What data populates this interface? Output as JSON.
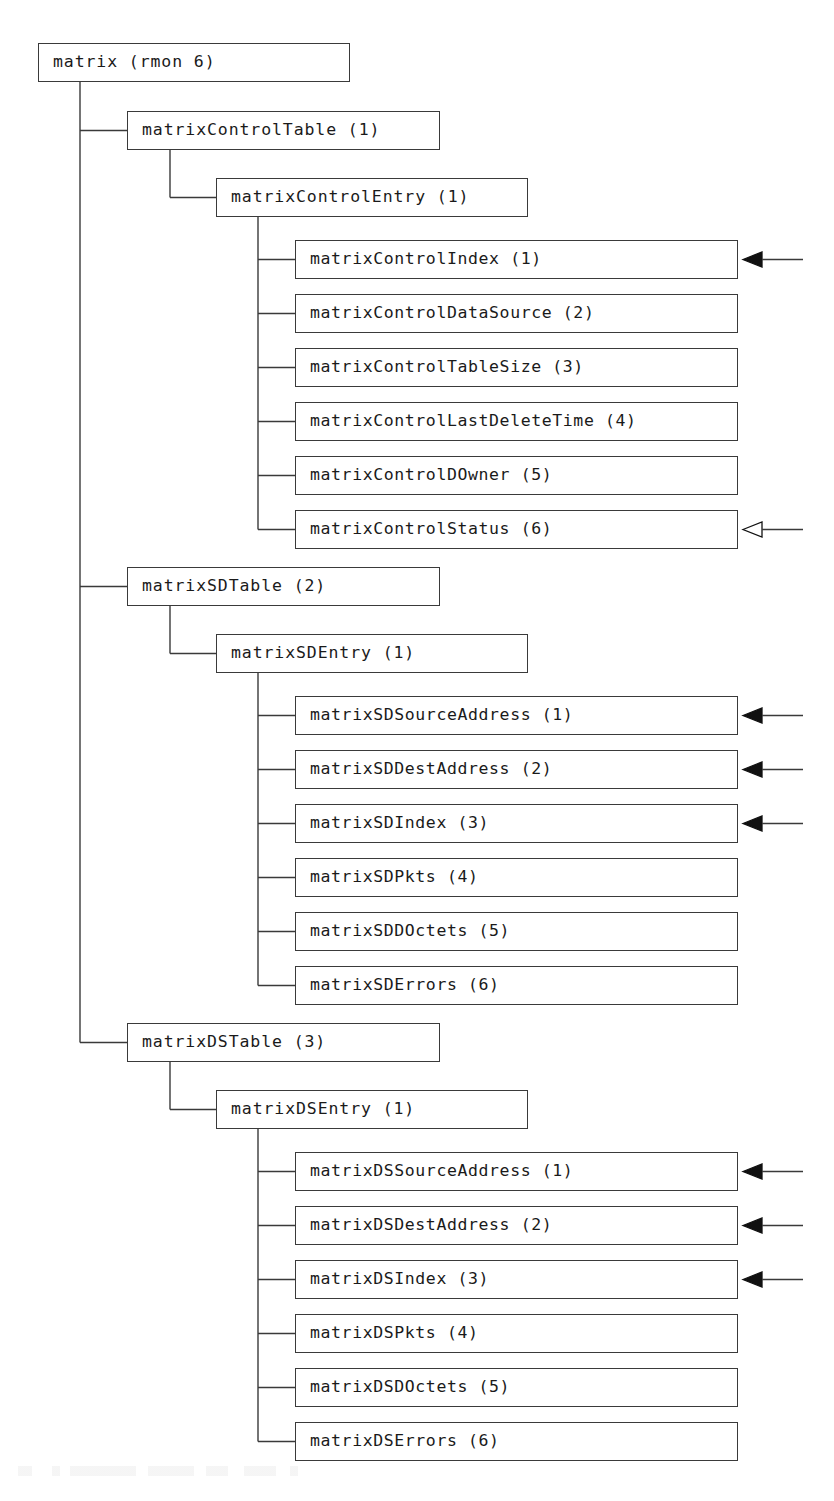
{
  "diagram": {
    "type": "mib-object-tree",
    "title": "matrix (rmon 6)",
    "colors": {
      "line": "#3a3a3a",
      "text": "#1a1a1a",
      "background": "#ffffff",
      "arrow_filled": "#111111",
      "arrow_hollow_fill": "#ffffff"
    },
    "arrow_legend": {
      "filled": "index object marker",
      "hollow": "status object marker"
    }
  },
  "root": {
    "label": "matrix (rmon 6)",
    "name": "matrix",
    "oid": "rmon 6"
  },
  "groups": [
    {
      "table": {
        "label": "matrixControlTable (1)",
        "name": "matrixControlTable",
        "oid": "1"
      },
      "entry": {
        "label": "matrixControlEntry (1)",
        "name": "matrixControlEntry",
        "oid": "1"
      },
      "leaves": [
        {
          "label": "matrixControlIndex (1)",
          "name": "matrixControlIndex",
          "oid": "1",
          "arrow": "filled"
        },
        {
          "label": "matrixControlDataSource (2)",
          "name": "matrixControlDataSource",
          "oid": "2",
          "arrow": "none"
        },
        {
          "label": "matrixControlTableSize (3)",
          "name": "matrixControlTableSize",
          "oid": "3",
          "arrow": "none"
        },
        {
          "label": "matrixControlLastDeleteTime (4)",
          "name": "matrixControlLastDeleteTime",
          "oid": "4",
          "arrow": "none"
        },
        {
          "label": "matrixControlDOwner (5)",
          "name": "matrixControlDOwner",
          "oid": "5",
          "arrow": "none"
        },
        {
          "label": "matrixControlStatus (6)",
          "name": "matrixControlStatus",
          "oid": "6",
          "arrow": "hollow"
        }
      ]
    },
    {
      "table": {
        "label": "matrixSDTable (2)",
        "name": "matrixSDTable",
        "oid": "2"
      },
      "entry": {
        "label": "matrixSDEntry (1)",
        "name": "matrixSDEntry",
        "oid": "1"
      },
      "leaves": [
        {
          "label": "matrixSDSourceAddress (1)",
          "name": "matrixSDSourceAddress",
          "oid": "1",
          "arrow": "filled"
        },
        {
          "label": "matrixSDDestAddress (2)",
          "name": "matrixSDDestAddress",
          "oid": "2",
          "arrow": "filled"
        },
        {
          "label": "matrixSDIndex (3)",
          "name": "matrixSDIndex",
          "oid": "3",
          "arrow": "filled"
        },
        {
          "label": "matrixSDPkts (4)",
          "name": "matrixSDPkts",
          "oid": "4",
          "arrow": "none"
        },
        {
          "label": "matrixSDDOctets (5)",
          "name": "matrixSDDOctets",
          "oid": "5",
          "arrow": "none"
        },
        {
          "label": "matrixSDErrors (6)",
          "name": "matrixSDErrors",
          "oid": "6",
          "arrow": "none"
        }
      ]
    },
    {
      "table": {
        "label": "matrixDSTable (3)",
        "name": "matrixDSTable",
        "oid": "3"
      },
      "entry": {
        "label": "matrixDSEntry (1)",
        "name": "matrixDSEntry",
        "oid": "1"
      },
      "leaves": [
        {
          "label": "matrixDSSourceAddress (1)",
          "name": "matrixDSSourceAddress",
          "oid": "1",
          "arrow": "filled"
        },
        {
          "label": "matrixDSDestAddress (2)",
          "name": "matrixDSDestAddress",
          "oid": "2",
          "arrow": "filled"
        },
        {
          "label": "matrixDSIndex (3)",
          "name": "matrixDSIndex",
          "oid": "3",
          "arrow": "filled"
        },
        {
          "label": "matrixDSPkts (4)",
          "name": "matrixDSPkts",
          "oid": "4",
          "arrow": "none"
        },
        {
          "label": "matrixDSDOctets (5)",
          "name": "matrixDSDOctets",
          "oid": "5",
          "arrow": "none"
        },
        {
          "label": "matrixDSErrors (6)",
          "name": "matrixDSErrors",
          "oid": "6",
          "arrow": "none"
        }
      ]
    }
  ]
}
